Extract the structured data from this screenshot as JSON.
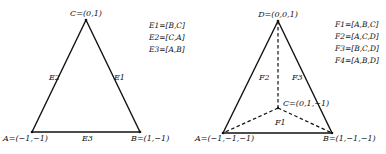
{
  "triangle": {
    "vertices": {
      "C": {
        "label": "C=(0,1)",
        "x": 86,
        "y": 20
      },
      "A": {
        "label": "A=(−1,−1)",
        "x": 32,
        "y": 132
      },
      "B": {
        "label": "B=(1,−1)",
        "x": 140,
        "y": 132
      }
    },
    "edges": {
      "E1": "E1",
      "E2": "E2",
      "E3": "E3"
    },
    "legend": [
      "E1=[B,C]",
      "E2=[C,A]",
      "E3=[A,B]"
    ]
  },
  "tetrahedron": {
    "vertices": {
      "D": {
        "label": "D=(0,0,1)",
        "x": 278,
        "y": 21
      },
      "A": {
        "label": "A=(−1,−1,−1)",
        "x": 223,
        "y": 133
      },
      "B": {
        "label": "B=(1,−1,−1)",
        "x": 332,
        "y": 133
      },
      "C": {
        "label": "C=(0,1,−1)",
        "x": 278,
        "y": 108
      }
    },
    "faces": {
      "F1": "F1",
      "F2": "F2",
      "F3": "F3"
    },
    "legend": [
      "F1=[A,B,C]",
      "F2=[A,C,D]",
      "F3=[B,C,D]",
      "F4=[A,B,D]"
    ]
  },
  "colors": {
    "line": "#111111",
    "background": "#ffffff"
  }
}
